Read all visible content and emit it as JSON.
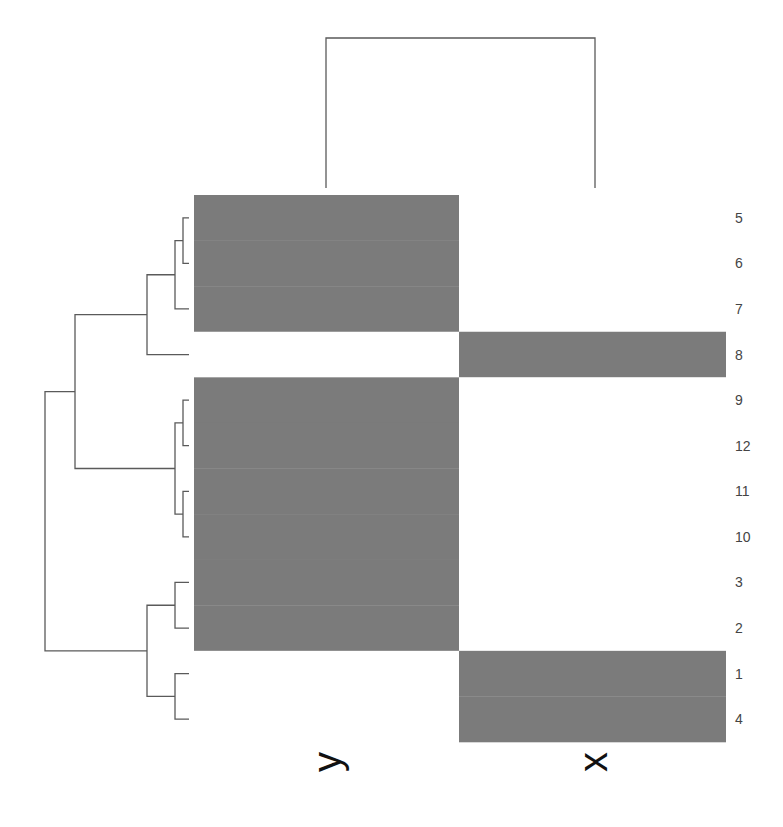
{
  "chart_data": {
    "type": "heatmap",
    "title": "",
    "xlabel": "",
    "ylabel": "",
    "columns": [
      "y",
      "x"
    ],
    "rows": [
      "5",
      "6",
      "7",
      "8",
      "9",
      "12",
      "11",
      "10",
      "3",
      "2",
      "1",
      "4"
    ],
    "values": [
      [
        1,
        0
      ],
      [
        1,
        0
      ],
      [
        1,
        0
      ],
      [
        0,
        1
      ],
      [
        1,
        0
      ],
      [
        1,
        0
      ],
      [
        1,
        0
      ],
      [
        1,
        0
      ],
      [
        1,
        0
      ],
      [
        1,
        0
      ],
      [
        0,
        1
      ],
      [
        0,
        1
      ]
    ],
    "color_scale": {
      "low": "#ffffff",
      "high": "#7b7b7b"
    },
    "row_dendrogram": true,
    "column_dendrogram": true,
    "grid": false,
    "legend": "none"
  },
  "colors": {
    "cell_high": "#7b7b7b",
    "cell_low": "#ffffff",
    "dendrogram_line": "#5a5a5a",
    "label_text": "#444444",
    "column_label_text": "#111111"
  }
}
